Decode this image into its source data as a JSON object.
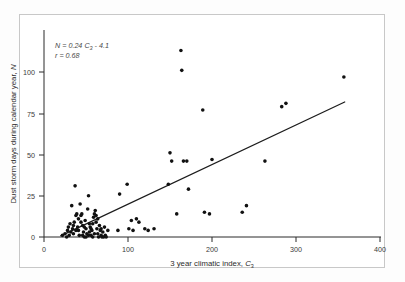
{
  "figure": {
    "background": "#ffffff",
    "frame_color": "#c8c8c8",
    "point_color": "#111111",
    "line_color": "#1c1c1c"
  },
  "annotation": {
    "equation_prefix": "N = 0.24 ",
    "equation_var": "C",
    "equation_sub": "3",
    "equation_suffix": " - 4.1",
    "correlation": "r  =  0.68"
  },
  "axes": {
    "x_title_main": "3 year climatic index, ",
    "x_title_var": "C",
    "x_title_sub": "3",
    "y_title_main": "Dust storm days during calendar year, ",
    "y_title_var": "N",
    "x_ticks": [
      "0",
      "100",
      "200",
      "300",
      "400"
    ],
    "y_ticks": [
      "0",
      "25",
      "50",
      "75",
      "100"
    ]
  },
  "chart_data": {
    "type": "scatter",
    "title": "",
    "xlabel": "3 year climatic index, C3",
    "ylabel": "Dust storm days during calendar year, N",
    "xlim": [
      0,
      400
    ],
    "ylim": [
      0,
      115
    ],
    "grid": false,
    "legend": false,
    "annotations": [
      "N = 0.24 C3 - 4.1",
      "r = 0.68"
    ],
    "fit_line": {
      "slope": 0.24,
      "intercept": -4.1,
      "r": 0.68,
      "x_start": 20,
      "x_end": 358
    },
    "points": [
      [
        22,
        1
      ],
      [
        25,
        2
      ],
      [
        27,
        0
      ],
      [
        28,
        4
      ],
      [
        29,
        6
      ],
      [
        30,
        1
      ],
      [
        31,
        8
      ],
      [
        32,
        3
      ],
      [
        33,
        19
      ],
      [
        34,
        5
      ],
      [
        35,
        2
      ],
      [
        36,
        9
      ],
      [
        37,
        31
      ],
      [
        38,
        13
      ],
      [
        39,
        14
      ],
      [
        40,
        6
      ],
      [
        41,
        4
      ],
      [
        42,
        1
      ],
      [
        43,
        20
      ],
      [
        44,
        13
      ],
      [
        45,
        14
      ],
      [
        46,
        7
      ],
      [
        47,
        3
      ],
      [
        48,
        0
      ],
      [
        49,
        10
      ],
      [
        50,
        5
      ],
      [
        51,
        2
      ],
      [
        52,
        17
      ],
      [
        53,
        25
      ],
      [
        54,
        8
      ],
      [
        55,
        6
      ],
      [
        56,
        1
      ],
      [
        57,
        4
      ],
      [
        58,
        0
      ],
      [
        59,
        12
      ],
      [
        60,
        14
      ],
      [
        61,
        16
      ],
      [
        62,
        9
      ],
      [
        63,
        5
      ],
      [
        64,
        2
      ],
      [
        65,
        0
      ],
      [
        66,
        7
      ],
      [
        67,
        4
      ],
      [
        68,
        1
      ],
      [
        69,
        0
      ],
      [
        70,
        3
      ],
      [
        71,
        0
      ],
      [
        72,
        6
      ],
      [
        73,
        1
      ],
      [
        74,
        0
      ],
      [
        62,
        13
      ],
      [
        64,
        11
      ],
      [
        58,
        8
      ],
      [
        54,
        3
      ],
      [
        48,
        6
      ],
      [
        44,
        9
      ],
      [
        41,
        11
      ],
      [
        38,
        4
      ],
      [
        35,
        7
      ],
      [
        46,
        1
      ],
      [
        50,
        0
      ],
      [
        53,
        1
      ],
      [
        56,
        5
      ],
      [
        60,
        2
      ],
      [
        68,
        5
      ],
      [
        76,
        4
      ],
      [
        88,
        4
      ],
      [
        90,
        26
      ],
      [
        99,
        32
      ],
      [
        101,
        5
      ],
      [
        104,
        10
      ],
      [
        106,
        4
      ],
      [
        110,
        11
      ],
      [
        113,
        9
      ],
      [
        120,
        5
      ],
      [
        124,
        4
      ],
      [
        131,
        5
      ],
      [
        148,
        32
      ],
      [
        150,
        51
      ],
      [
        152,
        46
      ],
      [
        158,
        14
      ],
      [
        163,
        113
      ],
      [
        164,
        101
      ],
      [
        166,
        46
      ],
      [
        170,
        46
      ],
      [
        172,
        29
      ],
      [
        189,
        77
      ],
      [
        191,
        15
      ],
      [
        197,
        14
      ],
      [
        200,
        47
      ],
      [
        236,
        15
      ],
      [
        241,
        19
      ],
      [
        263,
        46
      ],
      [
        283,
        79
      ],
      [
        288,
        81
      ],
      [
        357,
        97
      ]
    ]
  }
}
